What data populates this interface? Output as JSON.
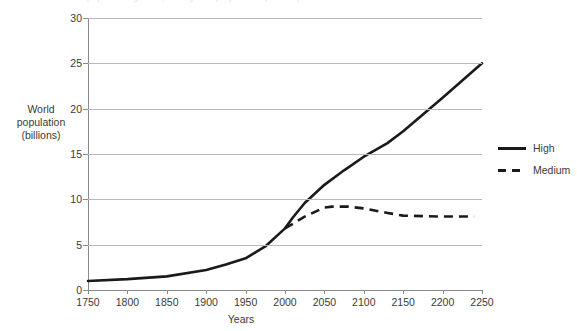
{
  "chart_data": {
    "type": "line",
    "title": "World population growth, history and projections (billions)",
    "xlabel": "Years",
    "ylabel": "World population (billions)",
    "ylabel_lines": [
      "World",
      "population",
      "(billions)"
    ],
    "xlim": [
      1750,
      2250
    ],
    "ylim": [
      0,
      30
    ],
    "ytick_labels": [
      "30",
      "25",
      "20",
      "15",
      "10",
      "5",
      "0"
    ],
    "ytick_values": [
      30,
      25,
      20,
      15,
      10,
      5,
      0
    ],
    "xtick_labels": [
      "1750",
      "1800",
      "1850",
      "1900",
      "1950",
      "2000",
      "2050",
      "2100",
      "2150",
      "2200",
      "2250"
    ],
    "xtick_values": [
      1750,
      1800,
      1850,
      1900,
      1950,
      2000,
      2050,
      2100,
      2150,
      2200,
      2250
    ],
    "grid": "horizontal",
    "legend_position": "right",
    "series": [
      {
        "name": "High",
        "style": "solid",
        "color": "#1a1a1a",
        "x": [
          1750,
          1800,
          1850,
          1900,
          1925,
          1950,
          1975,
          2000,
          2010,
          2025,
          2050,
          2075,
          2100,
          2130,
          2150,
          2200,
          2250
        ],
        "values": [
          1.0,
          1.2,
          1.5,
          2.2,
          2.8,
          3.5,
          4.8,
          6.8,
          8.0,
          9.6,
          11.6,
          13.2,
          14.7,
          16.2,
          17.5,
          21.2,
          25.0
        ]
      },
      {
        "name": "Medium",
        "style": "dashed",
        "color": "#1a1a1a",
        "x": [
          2000,
          2010,
          2025,
          2050,
          2060,
          2080,
          2100,
          2130,
          2150,
          2200,
          2240
        ],
        "values": [
          6.8,
          7.3,
          8.1,
          9.1,
          9.2,
          9.2,
          9.0,
          8.5,
          8.2,
          8.1,
          8.1
        ]
      }
    ]
  },
  "legend": {
    "items": [
      {
        "label": "High"
      },
      {
        "label": "Medium"
      }
    ]
  }
}
